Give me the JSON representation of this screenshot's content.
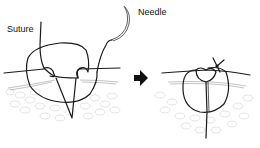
{
  "diagram": {
    "labels": {
      "suture": "Suture",
      "needle": "Needle"
    },
    "panels": [
      {
        "id": "before",
        "description": "Suture passed through skin in loop with needle attached"
      },
      {
        "id": "after",
        "description": "Suture tied with knot closing the wound"
      }
    ],
    "arrow": {
      "direction": "right"
    },
    "colors": {
      "line": "#1a1a1a",
      "tissue": "#c8c8c8",
      "background": "#ffffff"
    }
  }
}
